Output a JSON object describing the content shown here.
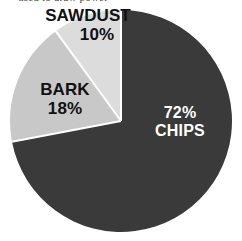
{
  "figure": {
    "background_color": "#ffffff",
    "top_caption_fragment": "used to draw power"
  },
  "chart_data": {
    "type": "pie",
    "title": "",
    "subtitle": "",
    "xlabel": "",
    "ylabel": "",
    "grid": false,
    "legend_position": "none",
    "labels_inside": true,
    "units": "percent",
    "total": 100,
    "start_angle_deg": 0,
    "direction": "clockwise",
    "center_px": {
      "x": 121,
      "y": 121
    },
    "radius_px": 111,
    "categories": [
      "CHIPS",
      "BARK",
      "SAWDUST"
    ],
    "values": [
      72,
      18,
      10
    ],
    "colors": [
      "#3a3a3a",
      "#c8c8c8",
      "#dcdcdc"
    ],
    "slices": [
      {
        "name": "CHIPS",
        "value": 72,
        "value_label": "72%",
        "name_label": "CHIPS",
        "color": "#3a3a3a",
        "label_color": "#ffffff",
        "start_angle_deg": 0,
        "end_angle_deg": 259.2
      },
      {
        "name": "BARK",
        "value": 18,
        "value_label": "18%",
        "name_label": "BARK",
        "color": "#c8c8c8",
        "label_color": "#111111",
        "start_angle_deg": 259.2,
        "end_angle_deg": 324.0
      },
      {
        "name": "SAWDUST",
        "value": 10,
        "value_label": "10%",
        "name_label": "SAWDUST",
        "color": "#dcdcdc",
        "label_color": "#111111",
        "start_angle_deg": 324.0,
        "end_angle_deg": 360.0
      }
    ]
  }
}
